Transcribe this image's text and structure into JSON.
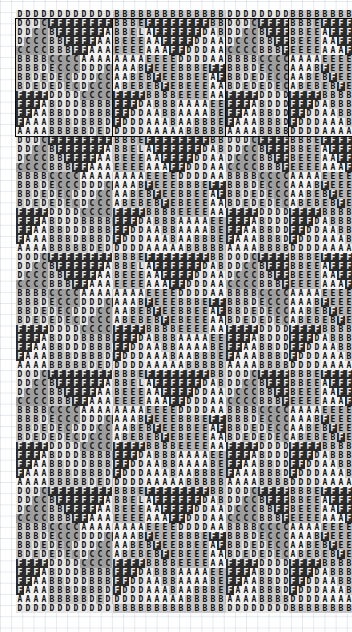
{
  "canvas": {
    "width": 352,
    "height": 632,
    "background": "#ffffff",
    "grid_line_color": "#aab9c8",
    "frame_color": "#0a0a0a"
  },
  "legend": {
    "glyphs": [
      "A",
      "B",
      "C",
      "D",
      "E",
      "F"
    ],
    "description": "character-cell heatmap tiling"
  },
  "palette": {
    "A": "#f2f2f2",
    "B": "#c9c9c9",
    "C": "#9e9e9e",
    "D": "#e6e6e6",
    "E": "#b5b5b5",
    "F": "#2a2a2a",
    "dark_text": "#111111",
    "light_text": "#f5f5f5"
  },
  "cell": {
    "width": 8,
    "height": 9,
    "font_size": 8
  },
  "layout": {
    "groups": [
      {
        "name": "group-1",
        "left": 16,
        "top": 10,
        "cols": 16,
        "tile_rows": 13,
        "repeats": 5,
        "framed_tile_index": 0,
        "edge_glyph": "D"
      },
      {
        "name": "group-2",
        "left": 113,
        "top": 10,
        "cols": 16,
        "tile_rows": 13,
        "repeats": 5,
        "framed_tile_index": 0,
        "edge_glyph": "B"
      },
      {
        "name": "group-3",
        "left": 226,
        "top": 10,
        "cols": 8,
        "tile_rows": 13,
        "repeats": 5,
        "framed_tile_index": 0,
        "edge_glyph": "D"
      },
      {
        "name": "group-4",
        "left": 289,
        "top": 10,
        "cols": 8,
        "tile_rows": 13,
        "repeats": 5,
        "framed_tile_index": 0,
        "edge_glyph": "B"
      }
    ]
  },
  "chart_data": {
    "type": "heatmap",
    "title": "",
    "xlabel": "",
    "ylabel": "",
    "legend_position": "none",
    "grid": true,
    "note": "Four vertically-tiled character-grid heatmaps. Each glyph A-F maps to a grey level; the first tile of every column is outlined.",
    "tiles": [
      {
        "name": "tile-1-wide",
        "cols": 16,
        "rows": [
          "DODCFFFFFFFFDODD",
          "DDCCBFFFFFFABDDD",
          "DCCCBBFFFFAABBDD",
          "CCCCBBBFFAAAABBB",
          "BBBBCCCCAAAABBBD",
          "BBBDECCCDDDCFFFF",
          "BBDEDECDDDCCBFFF",
          "BDEDEDECDCCCBBFF",
          "FFFFDDDDCCCCBBBF",
          "FFFABDDDBBBBCCCC",
          "FFAABBDDDBBBDECC",
          "FAAABBBDBBBDEDEC",
          "AAAABBBBBDEDEDEC"
        ]
      },
      {
        "name": "tile-2-wide",
        "cols": 16,
        "rows": [
          "BBBEFFFFFFFFBBBB",
          "BBELAFFFFFFDABBB",
          "BEEEAAFFFFDDAABB",
          "EEEEAAAFFDDDAAAB",
          "AAAAEEEEDDDDAAAA",
          "AAABFEEEBBBEFFFF",
          "AABEBFEEBBEEAFFF",
          "ABEBEBFEBEEEAAFF",
          "FFFFBBBBEEEEAAAF",
          "FFFDABBBAAAAEEEE",
          "FFDDAABBAAAABEEE",
          "FDDDAAABAABBBEEE",
          "DDDDAAAAABBBBBEE"
        ]
      },
      {
        "name": "tile-3-narrow",
        "cols": 8,
        "rows": [
          "DODCFFFF",
          "DDCCBFFF",
          "DCCCBBFF",
          "CCCCBBBF",
          "BBBBCCCC",
          "BBBDECCC",
          "BBDEDECC",
          "BDEDEDEC",
          "FFFFDDDD",
          "FFFABDDD",
          "FFAABBDD",
          "FAAABBBD",
          "AAAABBBB"
        ]
      },
      {
        "name": "tile-4-narrow",
        "cols": 8,
        "rows": [
          "BBBEFFFF",
          "BBEEAFFF",
          "BEEEAAFF",
          "EEEEAAAF",
          "AAAAEEEE",
          "AAABFEEE",
          "AABEBFEE",
          "ABEBEBFE",
          "FFFFBBBB",
          "FFFDABBB",
          "FFDDAABB",
          "FDDDAAAB",
          "DDDDAAAA"
        ]
      }
    ]
  }
}
